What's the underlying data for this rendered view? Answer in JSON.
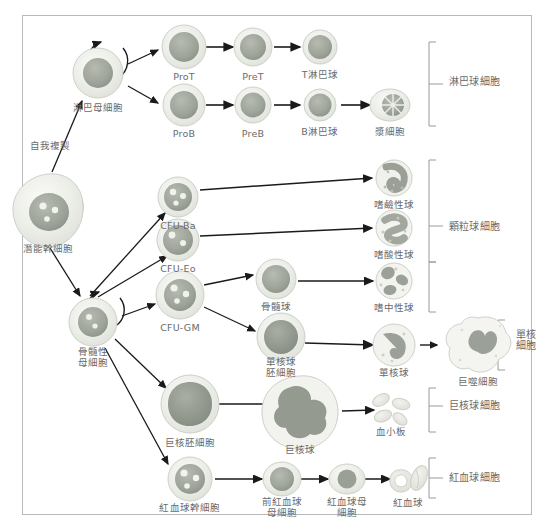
{
  "diagram": {
    "border_color": "#b9b9b9",
    "label_color": "#6a6a6a",
    "arrow_color": "#1a1a1a"
  },
  "annotations": {
    "self_renewal": "自我複製"
  },
  "cells": [
    {
      "id": "pluripotent-stem-cell",
      "label": "潛能幹細胞",
      "x": 48,
      "y": 210,
      "lx": 48,
      "ly": 248
    },
    {
      "id": "lymphoid-blast",
      "label": "淋巴母細胞",
      "x": 98,
      "y": 73,
      "lx": 98,
      "ly": 107
    },
    {
      "id": "myeloid-blast",
      "label": "骨髓性\n母細胞",
      "x": 93,
      "y": 322,
      "lx": 93,
      "ly": 352
    },
    {
      "id": "pro-t",
      "label": "ProT",
      "x": 184,
      "y": 47,
      "lx": 184,
      "ly": 76
    },
    {
      "id": "pre-t",
      "label": "PreT",
      "x": 253,
      "y": 47,
      "lx": 253,
      "ly": 76
    },
    {
      "id": "t-lymphocyte",
      "label": "T淋巴球",
      "x": 320,
      "y": 47,
      "lx": 320,
      "ly": 76
    },
    {
      "id": "pro-b",
      "label": "ProB",
      "x": 184,
      "y": 105,
      "lx": 184,
      "ly": 133
    },
    {
      "id": "pre-b",
      "label": "PreB",
      "x": 253,
      "y": 105,
      "lx": 253,
      "ly": 133
    },
    {
      "id": "b-lymphocyte",
      "label": "B淋巴球",
      "x": 320,
      "y": 105,
      "lx": 320,
      "ly": 133
    },
    {
      "id": "plasma-cell",
      "label": "漿細胞",
      "x": 390,
      "y": 105,
      "lx": 390,
      "ly": 133
    },
    {
      "id": "cfu-ba",
      "label": "CFU-Ba",
      "x": 178,
      "y": 197,
      "lx": 178,
      "ly": 224
    },
    {
      "id": "cfu-eo",
      "label": "CFU-Eo",
      "x": 178,
      "y": 240,
      "lx": 178,
      "ly": 268
    },
    {
      "id": "basophil",
      "label": "嗜鹼性球",
      "x": 394,
      "y": 178,
      "lx": 394,
      "ly": 205
    },
    {
      "id": "eosinophil",
      "label": "嗜酸性球",
      "x": 394,
      "y": 228,
      "lx": 394,
      "ly": 255
    },
    {
      "id": "cfu-gm",
      "label": "CFU-GM",
      "x": 180,
      "y": 295,
      "lx": 180,
      "ly": 325
    },
    {
      "id": "myelocyte",
      "label": "骨髓球",
      "x": 276,
      "y": 279,
      "lx": 276,
      "ly": 307
    },
    {
      "id": "neutrophil",
      "label": "嗜中性球",
      "x": 394,
      "y": 281,
      "lx": 394,
      "ly": 308
    },
    {
      "id": "monoblast",
      "label": "單核球\n胚細胞",
      "x": 281,
      "y": 337,
      "lx": 281,
      "ly": 363
    },
    {
      "id": "monocyte",
      "label": "單核球",
      "x": 394,
      "y": 345,
      "lx": 394,
      "ly": 373
    },
    {
      "id": "macrophage",
      "label": "巨噬細胞",
      "x": 478,
      "y": 347,
      "lx": 478,
      "ly": 383
    },
    {
      "id": "megakaryoblast",
      "label": "巨核胚細胞",
      "x": 190,
      "y": 404,
      "lx": 190,
      "ly": 443
    },
    {
      "id": "megakaryocyte",
      "label": "巨核球",
      "x": 300,
      "y": 411,
      "lx": 300,
      "ly": 450
    },
    {
      "id": "platelets",
      "label": "血小板",
      "x": 391,
      "y": 408,
      "lx": 391,
      "ly": 432
    },
    {
      "id": "erythrocyte-stem-cell",
      "label": "紅血球幹細胞",
      "x": 190,
      "y": 479,
      "lx": 190,
      "ly": 508
    },
    {
      "id": "proerythroblast",
      "label": "前紅血球\n母細胞",
      "x": 282,
      "y": 479,
      "lx": 282,
      "ly": 502
    },
    {
      "id": "erythroblast",
      "label": "紅血球母\n細胞",
      "x": 347,
      "y": 479,
      "lx": 347,
      "ly": 502
    },
    {
      "id": "red-blood-cell",
      "label": "紅血球",
      "x": 408,
      "y": 479,
      "lx": 408,
      "ly": 504
    }
  ],
  "brackets": [
    {
      "id": "lymphocytes",
      "label": "淋巴球細胞",
      "lx": 458,
      "ly": 81
    },
    {
      "id": "granulocytes",
      "label": "顆粒球細胞",
      "lx": 458,
      "ly": 226
    },
    {
      "id": "monocytes",
      "label": "單核\n細胞",
      "lx": 521,
      "ly": 336
    },
    {
      "id": "megakaryocytic",
      "label": "巨核球細胞",
      "lx": 458,
      "ly": 405
    },
    {
      "id": "erythrocytes",
      "label": "紅血球細胞",
      "lx": 458,
      "ly": 477
    }
  ]
}
